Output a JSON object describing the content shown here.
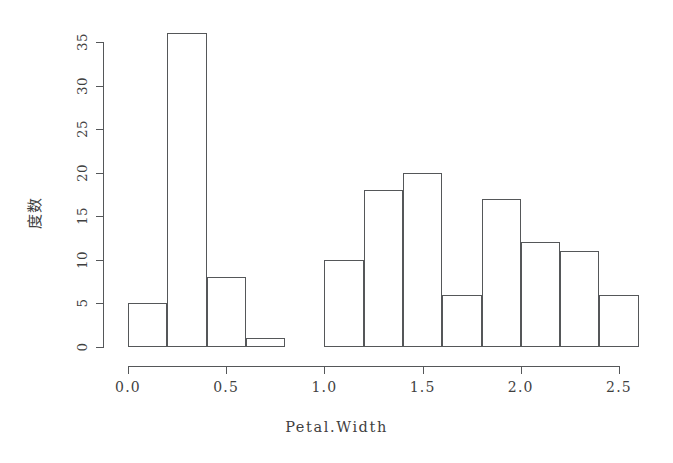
{
  "chart_data": {
    "type": "bar",
    "subtype": "histogram",
    "title": "",
    "xlabel": "Petal.Width",
    "ylabel": "度数",
    "xlim": [
      0.0,
      2.6
    ],
    "ylim": [
      0,
      36
    ],
    "binwidth": 0.2,
    "grid": false,
    "legend": null,
    "x_ticks": [
      "0.0",
      "0.5",
      "1.0",
      "1.5",
      "2.0",
      "2.5"
    ],
    "x_tick_values": [
      0.0,
      0.5,
      1.0,
      1.5,
      2.0,
      2.5
    ],
    "y_ticks": [
      "0",
      "5",
      "10",
      "15",
      "20",
      "25",
      "30",
      "35"
    ],
    "y_tick_values": [
      0,
      5,
      10,
      15,
      20,
      25,
      30,
      35
    ],
    "bins": [
      {
        "start": 0.0,
        "end": 0.2,
        "value": 5
      },
      {
        "start": 0.2,
        "end": 0.4,
        "value": 36
      },
      {
        "start": 0.4,
        "end": 0.6,
        "value": 8
      },
      {
        "start": 0.6,
        "end": 0.8,
        "value": 1
      },
      {
        "start": 0.8,
        "end": 1.0,
        "value": 0
      },
      {
        "start": 1.0,
        "end": 1.2,
        "value": 10
      },
      {
        "start": 1.2,
        "end": 1.4,
        "value": 18
      },
      {
        "start": 1.4,
        "end": 1.6,
        "value": 20
      },
      {
        "start": 1.6,
        "end": 1.8,
        "value": 6
      },
      {
        "start": 1.8,
        "end": 2.0,
        "value": 17
      },
      {
        "start": 2.0,
        "end": 2.2,
        "value": 12
      },
      {
        "start": 2.2,
        "end": 2.4,
        "value": 11
      },
      {
        "start": 2.4,
        "end": 2.6,
        "value": 6
      }
    ],
    "categories": [
      "0.0-0.2",
      "0.2-0.4",
      "0.4-0.6",
      "0.6-0.8",
      "0.8-1.0",
      "1.0-1.2",
      "1.2-1.4",
      "1.4-1.6",
      "1.6-1.8",
      "1.8-2.0",
      "2.0-2.2",
      "2.2-2.4",
      "2.4-2.6"
    ],
    "values": [
      5,
      36,
      8,
      1,
      0,
      10,
      18,
      20,
      6,
      17,
      12,
      11,
      6
    ],
    "colors": {
      "bar_border": "#555759",
      "bar_fill": "transparent",
      "axis": "#555759",
      "text": "#3f3f3f",
      "background": "#ffffff"
    }
  }
}
